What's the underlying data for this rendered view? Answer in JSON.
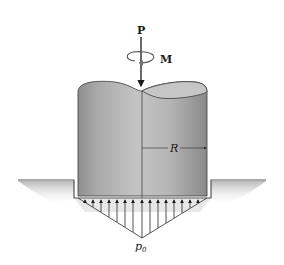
{
  "diagram": {
    "type": "mechanics-free-body",
    "labels": {
      "force": "P",
      "moment": "M",
      "radius": "R",
      "pressure_symbol": "p",
      "pressure_subscript": "0"
    },
    "colors": {
      "cylinder_light": "#c8c8c8",
      "cylinder_dark": "#8e8e8e",
      "cylinder_top": "#b5b5b5",
      "ground_shadow": "#bdbdbd",
      "line": "#2a2a2a"
    },
    "pressure_arrows_count": 15
  }
}
